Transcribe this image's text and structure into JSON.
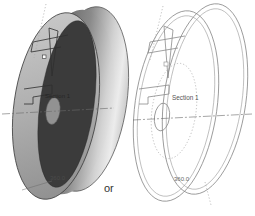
{
  "window": {
    "background_color": "#ffffff",
    "description": "CAD illustration of a revolved cylinder shown shaded and as wireframe"
  },
  "figures": {
    "left": {
      "description": "shaded 3D revolved cylinder",
      "section_label": "Section 1",
      "revolve_angle_label": "360.0"
    },
    "right": {
      "description": "wireframe 3D revolved cylinder",
      "section_label": "Section 1",
      "revolve_angle_label": "360.0"
    },
    "connector_text": "or"
  },
  "colors": {
    "outline": "#3f3f3f",
    "wire_line": "#8a8a8a",
    "centerline": "#6a6a6a",
    "construction_line": "#a8a8a8",
    "disc_dark": "#3b3b3b",
    "hub_gray": "#929292",
    "label_text": "#555555",
    "connector_text": "#333333"
  }
}
